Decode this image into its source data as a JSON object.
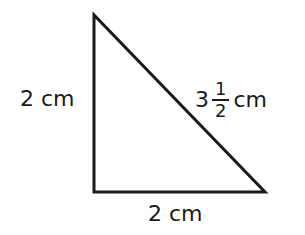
{
  "diagram": {
    "type": "right-triangle",
    "vertices": {
      "top": [
        94,
        15
      ],
      "bottom_left": [
        94,
        192
      ],
      "bottom_right": [
        265,
        192
      ]
    },
    "stroke_color": "#1a1a1a",
    "labels": {
      "left_side": "2 cm",
      "bottom_side": "2 cm",
      "hypotenuse": {
        "whole": "3",
        "numerator": "1",
        "denominator": "2",
        "unit": "cm"
      }
    }
  }
}
